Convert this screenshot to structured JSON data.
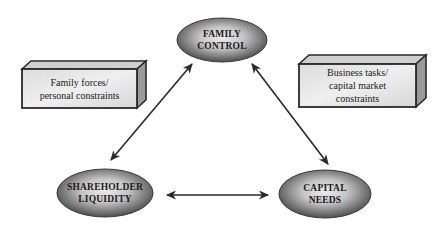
{
  "diagram": {
    "type": "triangle-relationship",
    "nodes": [
      {
        "id": "family-control",
        "line1": "FAMILY",
        "line2": "CONTROL"
      },
      {
        "id": "shareholder-liquidity",
        "line1": "SHAREHOLDER",
        "line2": "LIQUIDITY"
      },
      {
        "id": "capital-needs",
        "line1": "CAPITAL",
        "line2": "NEEDS"
      }
    ],
    "boxes": [
      {
        "id": "family-forces",
        "lines": [
          "Family forces/",
          "personal constraints"
        ]
      },
      {
        "id": "business-tasks",
        "lines": [
          "Business tasks/",
          "capital market",
          "constraints"
        ]
      }
    ],
    "edges": [
      {
        "from": "family-control",
        "to": "shareholder-liquidity",
        "style": "bidirectional"
      },
      {
        "from": "family-control",
        "to": "capital-needs",
        "style": "bidirectional"
      },
      {
        "from": "shareholder-liquidity",
        "to": "capital-needs",
        "style": "bidirectional"
      }
    ],
    "colors": {
      "ellipse_light": "#e6e6e6",
      "ellipse_dark": "#5a5a5a",
      "box_front": "#e4e4e4",
      "box_top": "#d0d0d0",
      "box_side": "#9a9a9a",
      "stroke": "#2a2a2a"
    }
  }
}
